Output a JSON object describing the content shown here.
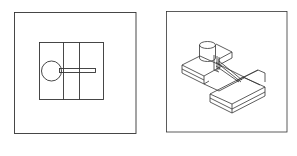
{
  "figure": {
    "panels": [
      {
        "id": "top-view",
        "description": "Top (plan) view of block with cylinder and rod"
      },
      {
        "id": "isometric-view",
        "description": "Isometric wireframe view of stepped block with cylinder and rod"
      }
    ],
    "colors": {
      "line": "#2a2a2a",
      "frame": "#3a3a3a",
      "background": "#ffffff"
    }
  }
}
